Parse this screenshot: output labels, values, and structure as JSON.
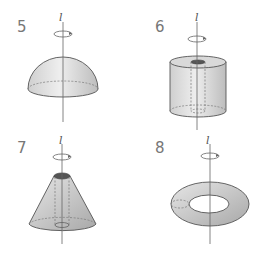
{
  "figures": [
    {
      "number": "5",
      "axis_label": "l",
      "shape": "hemisphere"
    },
    {
      "number": "6",
      "axis_label": "l",
      "shape": "cylinder-with-hole"
    },
    {
      "number": "7",
      "axis_label": "l",
      "shape": "cone-with-hole"
    },
    {
      "number": "8",
      "axis_label": "l",
      "shape": "torus"
    }
  ],
  "colors": {
    "stroke": "#555555",
    "fill_light": "#f2f2f2",
    "fill_dark": "#b5b5b5",
    "number": "#777777"
  }
}
